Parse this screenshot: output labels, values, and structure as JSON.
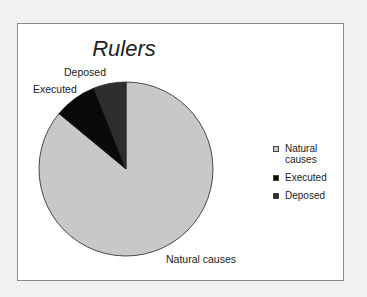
{
  "chart_data": {
    "type": "pie",
    "title": "Rulers",
    "categories": [
      "Natural causes",
      "Executed",
      "Deposed"
    ],
    "values": [
      86,
      8,
      6
    ],
    "colors": [
      "#c8c8c8",
      "#0a0a0a",
      "#2e2e2e"
    ],
    "legend_position": "right",
    "data_labels": [
      "Natural causes",
      "Executed",
      "Deposed"
    ]
  },
  "legend": {
    "items": [
      {
        "label": "Natural causes",
        "color": "#c8c8c8"
      },
      {
        "label": "Executed",
        "color": "#0a0a0a"
      },
      {
        "label": "Deposed",
        "color": "#2e2e2e"
      }
    ]
  }
}
